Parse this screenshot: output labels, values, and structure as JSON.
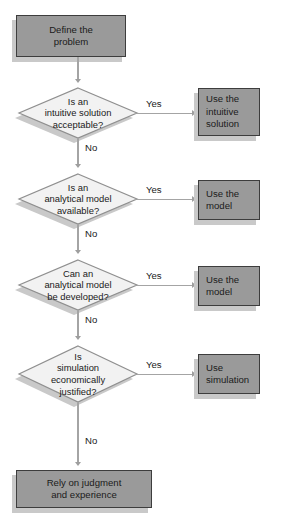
{
  "diagram": {
    "colors": {
      "box_fill": "#9a9a9a",
      "box_border": "#3d3d3d",
      "diamond_fill": "#f2f2f2",
      "diamond_border": "#8f8f8f",
      "shadow": "#c9c9c9",
      "connector": "#a4a4a4",
      "background": "#ffffff",
      "text": "#1a1a1a"
    },
    "start": {
      "label": "Define the\nproblem"
    },
    "end": {
      "label": "Rely on judgment\nand experience"
    },
    "decisions": [
      {
        "question": "Is an\nintuitive solution\nacceptable?",
        "yes_label": "Yes",
        "no_label": "No",
        "yes_target": "Use the\nintuitive\nsolution"
      },
      {
        "question": "Is an\nanalytical model\navailable?",
        "yes_label": "Yes",
        "no_label": "No",
        "yes_target": "Use the\nmodel"
      },
      {
        "question": "Can an\nanalytical model\nbe developed?",
        "yes_label": "Yes",
        "no_label": "No",
        "yes_target": "Use the\nmodel"
      },
      {
        "question": "Is\nsimulation\neconomically\njustified?",
        "yes_label": "Yes",
        "no_label": "No",
        "yes_target": "Use\nsimulation"
      }
    ]
  }
}
